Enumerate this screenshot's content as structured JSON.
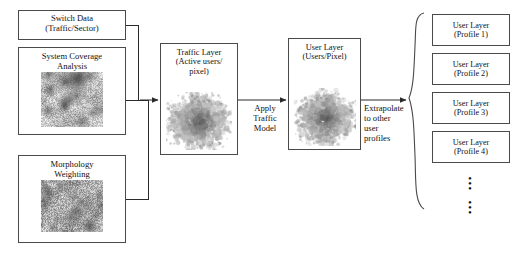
{
  "diagram": {
    "inputs": [
      {
        "id": "switch-data",
        "label": "Switch Data\n(Traffic/Sector)",
        "has_image": false
      },
      {
        "id": "system-coverage",
        "label": "System Coverage\nAnalysis",
        "has_image": true,
        "image_name": "coverage-map-raster"
      },
      {
        "id": "morphology",
        "label": "Morphology\nWeighting",
        "has_image": true,
        "image_name": "morphology-map-raster"
      }
    ],
    "stages": [
      {
        "id": "traffic-layer",
        "label": "Traffic Layer\n(Active users/\npixel)",
        "image_name": "traffic-layer-raster"
      },
      {
        "id": "user-layer",
        "label": "User Layer\n(Users/Pixel)",
        "image_name": "user-layer-raster"
      }
    ],
    "connector_labels": {
      "apply_traffic_model": "Apply\nTraffic\nModel",
      "extrapolate": "Extrapolate\nto other\nuser\nprofiles"
    },
    "profiles": [
      {
        "label": "User Layer\n(Profile 1)"
      },
      {
        "label": "User Layer\n(Profile 2)"
      },
      {
        "label": "User Layer\n(Profile 3)"
      },
      {
        "label": "User Layer\n(Profile 4)"
      }
    ],
    "ellipsis": {
      "group_a": "•\n•\n•",
      "group_b": "•\n•\n•"
    },
    "colors": {
      "background": "#ffffff",
      "box_border": "#4a4a4a",
      "text": "#111111",
      "wire": "#2b2b2b"
    }
  }
}
